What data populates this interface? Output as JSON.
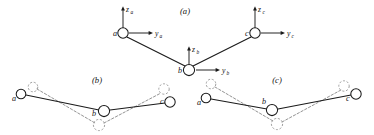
{
  "figure": {
    "background_color": "#ffffff",
    "ink_color": "#1a1a1a",
    "ghost_color": "#9a9a9a",
    "width": 374,
    "height": 135,
    "panels": [
      {
        "id": "panel-a",
        "label": "(a)",
        "label_x": 185,
        "label_y": 14
      },
      {
        "id": "panel-b",
        "label": "(b)",
        "label_x": 97,
        "label_y": 82
      },
      {
        "id": "panel-c",
        "label": "(c)",
        "label_x": 277,
        "label_y": 82
      }
    ],
    "panel_a": {
      "atoms": [
        {
          "name": "a",
          "label": "a",
          "cx": 123,
          "cy": 33,
          "r": 5.2,
          "label_x": 113,
          "label_y": 36
        },
        {
          "name": "b",
          "label": "b",
          "cx": 189,
          "cy": 70,
          "r": 5.6,
          "label_x": 178,
          "label_y": 73
        },
        {
          "name": "c",
          "label": "c",
          "cx": 255,
          "cy": 33,
          "r": 5.2,
          "label_x": 245,
          "label_y": 36
        }
      ],
      "bonds": [
        {
          "from": "a",
          "to": "b",
          "x1": 127,
          "y1": 37,
          "x2": 185,
          "y2": 66
        },
        {
          "from": "b",
          "to": "c",
          "x1": 193,
          "y1": 66,
          "x2": 251,
          "y2": 37
        }
      ],
      "axes": [
        {
          "name": "z_a",
          "base": "z",
          "sub": "a",
          "x1": 123,
          "y1": 28,
          "x2": 123,
          "y2": 8,
          "dir": "up",
          "label_x": 126,
          "label_y": 11,
          "sub_x": 131,
          "sub_y": 13
        },
        {
          "name": "y_a",
          "base": "y",
          "sub": "a",
          "x1": 129,
          "y1": 33,
          "x2": 152,
          "y2": 33,
          "dir": "right",
          "label_x": 155,
          "label_y": 36,
          "sub_x": 160,
          "sub_y": 38
        },
        {
          "name": "z_b",
          "base": "z",
          "sub": "b",
          "x1": 189,
          "y1": 64,
          "x2": 189,
          "y2": 48,
          "dir": "up",
          "label_x": 192,
          "label_y": 51,
          "sub_x": 197,
          "sub_y": 53
        },
        {
          "name": "y_b",
          "base": "y",
          "sub": "b",
          "x1": 196,
          "y1": 70,
          "x2": 219,
          "y2": 70,
          "dir": "right",
          "label_x": 222,
          "label_y": 73,
          "sub_x": 227,
          "sub_y": 75
        },
        {
          "name": "z_c",
          "base": "z",
          "sub": "c",
          "x1": 255,
          "y1": 28,
          "x2": 255,
          "y2": 8,
          "dir": "up",
          "label_x": 258,
          "label_y": 11,
          "sub_x": 263,
          "sub_y": 13
        },
        {
          "name": "y_c",
          "base": "y",
          "sub": "c",
          "x1": 261,
          "y1": 33,
          "x2": 284,
          "y2": 33,
          "dir": "right",
          "label_x": 287,
          "label_y": 36,
          "sub_x": 292,
          "sub_y": 38
        }
      ]
    },
    "panel_b": {
      "atoms": [
        {
          "name": "a",
          "label": "a",
          "cx": 21,
          "cy": 94,
          "r": 4.8,
          "label_x": 12,
          "label_y": 100
        },
        {
          "name": "b",
          "label": "b",
          "cx": 104,
          "cy": 111,
          "r": 5.6,
          "label_x": 93,
          "label_y": 115
        },
        {
          "name": "c",
          "label": "c",
          "cx": 170,
          "cy": 102,
          "r": 5.2,
          "label_x": 160,
          "label_y": 104
        }
      ],
      "ghost_atoms": [
        {
          "name": "a-ghost",
          "cx": 33,
          "cy": 87,
          "r": 4.8
        },
        {
          "name": "b-ghost",
          "cx": 99,
          "cy": 125,
          "r": 5.6
        },
        {
          "name": "c-ghost",
          "cx": 164,
          "cy": 89,
          "r": 5.2
        }
      ],
      "bonds_solid": [
        {
          "from": "a",
          "to": "b",
          "x1": 26,
          "y1": 95,
          "x2": 99,
          "y2": 110
        },
        {
          "from": "b",
          "to": "c",
          "x1": 110,
          "y1": 110,
          "x2": 165,
          "y2": 103
        }
      ],
      "bonds_dashed": [
        {
          "from": "a-ghost",
          "to": "b-ghost",
          "x1": 37,
          "y1": 89,
          "x2": 95,
          "y2": 123
        },
        {
          "from": "b-ghost",
          "to": "c-ghost",
          "x1": 104,
          "y1": 123,
          "x2": 161,
          "y2": 93
        }
      ]
    },
    "panel_c": {
      "atoms": [
        {
          "name": "a",
          "label": "a",
          "cx": 206,
          "cy": 98,
          "r": 4.8,
          "label_x": 197,
          "label_y": 104
        },
        {
          "name": "b",
          "label": "b",
          "cx": 272,
          "cy": 110,
          "r": 5.6,
          "label_x": 262,
          "label_y": 106
        },
        {
          "name": "c",
          "label": "c",
          "cx": 356,
          "cy": 94,
          "r": 5.2,
          "label_x": 346,
          "label_y": 100
        }
      ],
      "ghost_atoms": [
        {
          "name": "a-ghost",
          "cx": 211,
          "cy": 84,
          "r": 4.8
        },
        {
          "name": "b-ghost",
          "cx": 277,
          "cy": 124,
          "r": 5.6
        },
        {
          "name": "c-ghost",
          "cx": 344,
          "cy": 86,
          "r": 5.2
        }
      ],
      "bonds_solid": [
        {
          "from": "a",
          "to": "b",
          "x1": 211,
          "y1": 99,
          "x2": 267,
          "y2": 109
        },
        {
          "from": "b",
          "to": "c",
          "x1": 278,
          "y1": 109,
          "x2": 351,
          "y2": 95
        }
      ],
      "bonds_dashed": [
        {
          "from": "a-ghost",
          "to": "b-ghost",
          "x1": 215,
          "y1": 87,
          "x2": 273,
          "y2": 121
        },
        {
          "from": "b-ghost",
          "to": "c-ghost",
          "x1": 282,
          "y1": 122,
          "x2": 341,
          "y2": 90
        }
      ]
    }
  }
}
